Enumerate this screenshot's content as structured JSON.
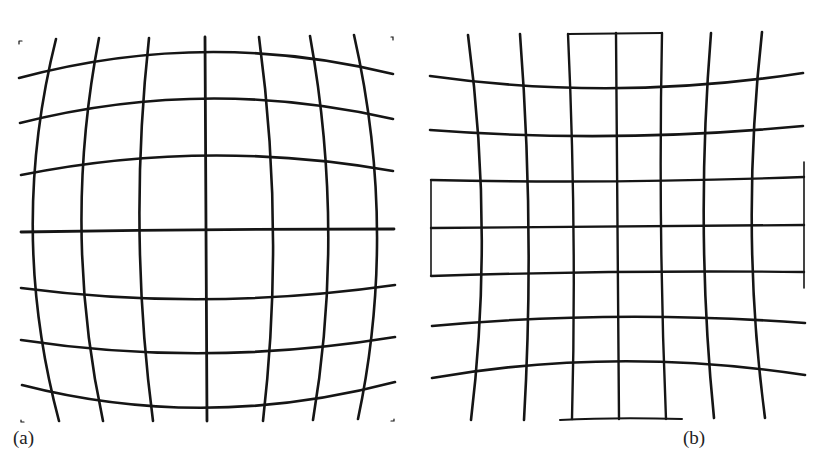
{
  "figure": {
    "panels": [
      {
        "id": "a",
        "label": "(a)",
        "distortion": "barrel",
        "grid": {
          "vertical_lines": 7,
          "horizontal_lines": 7
        }
      },
      {
        "id": "b",
        "label": "(b)",
        "distortion": "pincushion",
        "grid": {
          "vertical_lines": 9,
          "horizontal_lines": 7
        }
      }
    ],
    "colors": {
      "line": "#151515",
      "background": "#ffffff"
    }
  }
}
